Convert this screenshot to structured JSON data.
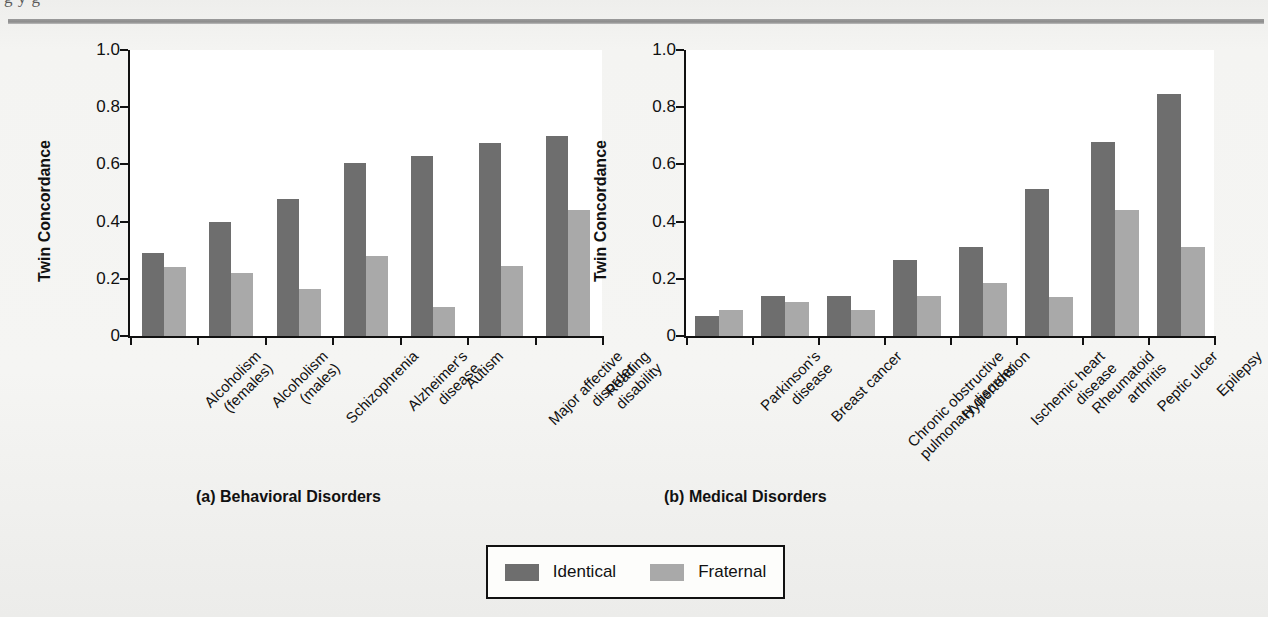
{
  "figure": {
    "top_cropped_line": "g        y  g",
    "legend": {
      "items": [
        {
          "name": "identical",
          "label": "Identical",
          "color": "#6e6e6e"
        },
        {
          "name": "fraternal",
          "label": "Fraternal",
          "color": "#a9a9a9"
        }
      ]
    }
  },
  "chart_data": [
    {
      "type": "bar",
      "panel_id": "a",
      "title": "(a) Behavioral Disorders",
      "xlabel": "",
      "ylabel": "Twin Concordance",
      "ylim": [
        0,
        1.0
      ],
      "yticks": [
        0,
        0.2,
        0.4,
        0.6,
        0.8,
        1.0
      ],
      "ytick_labels": [
        "0",
        "0.2",
        "0.4",
        "0.6",
        "0.8",
        "1.0"
      ],
      "grid": false,
      "legend_position": "bottom-center-shared",
      "categories": [
        "Alcoholism\n(females)",
        "Alcoholism\n(males)",
        "Schizophrenia",
        "Alzheimer's\ndisease",
        "Autism",
        "Major affective\ndisorder",
        "Reading\ndisability"
      ],
      "category_lines": [
        [
          "Alcoholism",
          "(females)"
        ],
        [
          "Alcoholism",
          "(males)"
        ],
        [
          "Schizophrenia"
        ],
        [
          "Alzheimer's",
          "disease"
        ],
        [
          "Autism"
        ],
        [
          "Major affective",
          "disorder"
        ],
        [
          "Reading",
          "disability"
        ]
      ],
      "series": [
        {
          "name": "Identical",
          "color": "#6e6e6e",
          "values": [
            0.29,
            0.4,
            0.48,
            0.605,
            0.63,
            0.675,
            0.7
          ]
        },
        {
          "name": "Fraternal",
          "color": "#a9a9a9",
          "values": [
            0.24,
            0.22,
            0.165,
            0.28,
            0.1,
            0.245,
            0.44
          ]
        }
      ]
    },
    {
      "type": "bar",
      "panel_id": "b",
      "title": "(b) Medical Disorders",
      "xlabel": "",
      "ylabel": "Twin Concordance",
      "ylim": [
        0,
        1.0
      ],
      "yticks": [
        0,
        0.2,
        0.4,
        0.6,
        0.8,
        1.0
      ],
      "ytick_labels": [
        "0",
        "0.2",
        "0.4",
        "0.6",
        "0.8",
        "1.0"
      ],
      "grid": false,
      "legend_position": "bottom-center-shared",
      "categories": [
        "Parkinson's\ndisease",
        "Breast cancer",
        "Chronic obstructive\npulmonary disorder",
        "Hypertension",
        "Ischemic heart\ndisease",
        "Rheumatoid\narthritis",
        "Peptic ulcer",
        "Epilepsy"
      ],
      "category_lines": [
        [
          "Parkinson's",
          "disease"
        ],
        [
          "Breast cancer"
        ],
        [
          "Chronic obstructive",
          "pulmonary disorder"
        ],
        [
          "Hypertension"
        ],
        [
          "Ischemic heart",
          "disease"
        ],
        [
          "Rheumatoid",
          "arthritis"
        ],
        [
          "Peptic ulcer"
        ],
        [
          "Epilepsy"
        ]
      ],
      "series": [
        {
          "name": "Identical",
          "color": "#6e6e6e",
          "values": [
            0.07,
            0.14,
            0.14,
            0.265,
            0.31,
            0.515,
            0.68,
            0.845
          ]
        },
        {
          "name": "Fraternal",
          "color": "#a9a9a9",
          "values": [
            0.09,
            0.12,
            0.09,
            0.14,
            0.185,
            0.135,
            0.44,
            0.31
          ]
        }
      ]
    }
  ]
}
